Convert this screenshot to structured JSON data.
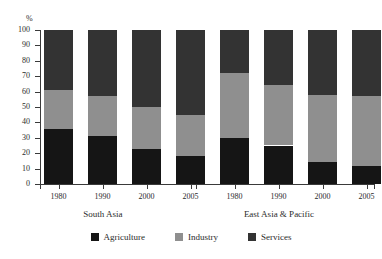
{
  "chart_data": {
    "type": "bar",
    "subtype": "stacked-percentage",
    "title": "",
    "subtitle": "",
    "xlabel": "",
    "ylabel": "%",
    "ylim": [
      0,
      100
    ],
    "ytick_step": 10,
    "yticks": [
      100,
      90,
      80,
      70,
      60,
      50,
      40,
      30,
      20,
      10,
      0
    ],
    "grid": false,
    "legend_position": "bottom-center",
    "categories": [
      "1980",
      "1990",
      "2000",
      "2005",
      "1980",
      "1990",
      "2000",
      "2005"
    ],
    "groups": [
      {
        "name": "South Asia",
        "categories": [
          "1980",
          "1990",
          "2000",
          "2005"
        ],
        "series": [
          {
            "name": "Agriculture",
            "values": [
              36,
              31,
              23,
              18
            ]
          },
          {
            "name": "Industry",
            "values": [
              25,
              26,
              27,
              27
            ]
          },
          {
            "name": "Services",
            "values": [
              39,
              43,
              50,
              55
            ]
          }
        ],
        "cumulative_tops": {
          "Agriculture": [
            36,
            31,
            23,
            18
          ],
          "Industry": [
            61,
            57,
            50,
            45
          ],
          "Services": [
            100,
            100,
            100,
            100
          ]
        }
      },
      {
        "name": "East Asia & Pacific",
        "categories": [
          "1980",
          "1990",
          "2000",
          "2005"
        ],
        "series": [
          {
            "name": "Agriculture",
            "values": [
              30,
              25,
              14,
              12
            ]
          },
          {
            "name": "Industry",
            "values": [
              42,
              39,
              44,
              45
            ]
          },
          {
            "name": "Services",
            "values": [
              28,
              36,
              42,
              43
            ]
          }
        ],
        "cumulative_tops": {
          "Agriculture": [
            30,
            25,
            14,
            12
          ],
          "Industry": [
            72,
            64,
            58,
            57
          ],
          "Services": [
            100,
            100,
            100,
            100
          ]
        }
      }
    ],
    "legend": [
      {
        "name": "Agriculture",
        "color": "#151515"
      },
      {
        "name": "Industry",
        "color": "#8f8f8f"
      },
      {
        "name": "Services",
        "color": "#333333"
      }
    ],
    "colors": {
      "agriculture": "#151515",
      "industry": "#8f8f8f",
      "services": "#333333",
      "axis": "#3a3a3a",
      "background": "#ffffff"
    }
  },
  "axis": {
    "unit_label": "%",
    "tick_labels": [
      "100",
      "90",
      "80",
      "70",
      "60",
      "50",
      "40",
      "30",
      "20",
      "10",
      "0"
    ]
  },
  "xaxis": {
    "labels": [
      "1980",
      "1990",
      "2000",
      "2005",
      "1980",
      "1990",
      "2000",
      "2005"
    ]
  },
  "group_labels": {
    "left": "South Asia",
    "right": "East Asia & Pacific"
  },
  "legend": {
    "items": [
      {
        "label": "Agriculture"
      },
      {
        "label": "Industry"
      },
      {
        "label": "Services"
      }
    ]
  }
}
